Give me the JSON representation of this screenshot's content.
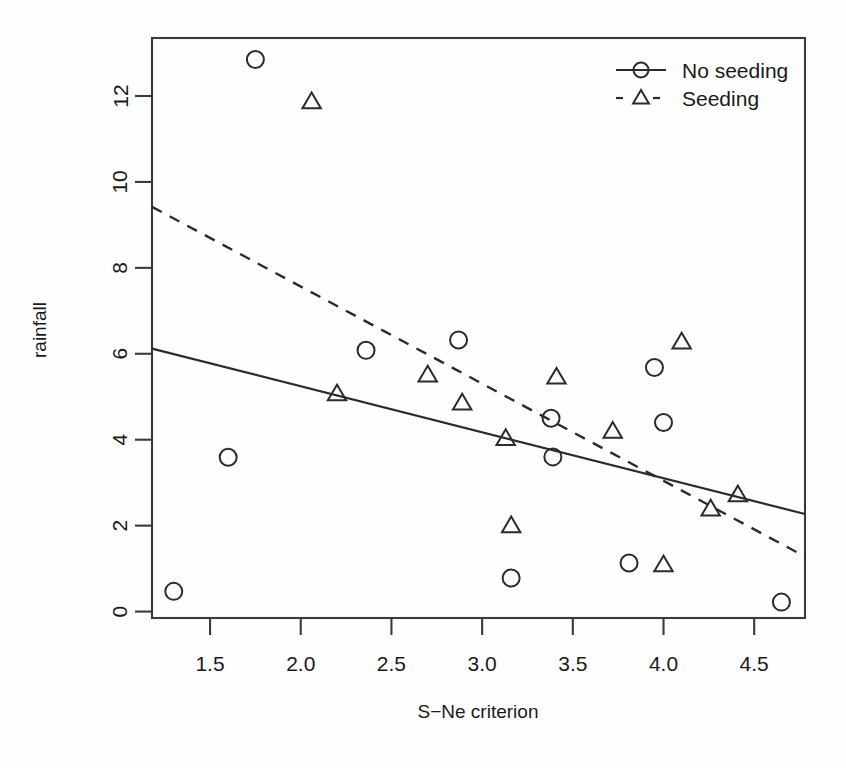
{
  "chart_data": {
    "type": "scatter",
    "title": "",
    "xlabel": "S−Ne criterion",
    "ylabel": "rainfall",
    "xlim": [
      1.18,
      4.78
    ],
    "ylim": [
      -0.15,
      13.35
    ],
    "xticks": [
      1.5,
      2.0,
      2.5,
      3.0,
      3.5,
      4.0,
      4.5
    ],
    "xtick_labels": [
      "1.5",
      "2.0",
      "2.5",
      "3.0",
      "3.5",
      "4.0",
      "4.5"
    ],
    "yticks": [
      0,
      2,
      4,
      6,
      8,
      10,
      12
    ],
    "ytick_labels": [
      "0",
      "2",
      "4",
      "6",
      "8",
      "10",
      "12"
    ],
    "grid": false,
    "legend_position": "top-right",
    "series": [
      {
        "name": "No seeding",
        "marker": "circle",
        "linestyle": "solid",
        "points": [
          {
            "x": 1.3,
            "y": 0.47
          },
          {
            "x": 1.6,
            "y": 3.59
          },
          {
            "x": 1.75,
            "y": 12.85
          },
          {
            "x": 2.36,
            "y": 6.08
          },
          {
            "x": 2.87,
            "y": 6.32
          },
          {
            "x": 3.16,
            "y": 0.78
          },
          {
            "x": 3.38,
            "y": 4.5
          },
          {
            "x": 3.39,
            "y": 3.6
          },
          {
            "x": 3.81,
            "y": 1.13
          },
          {
            "x": 3.95,
            "y": 5.68
          },
          {
            "x": 4.0,
            "y": 4.4
          },
          {
            "x": 4.65,
            "y": 0.22
          }
        ],
        "fit_line": {
          "x1": 1.18,
          "y1": 6.12,
          "x2": 4.78,
          "y2": 2.27
        }
      },
      {
        "name": "Seeding",
        "marker": "triangle",
        "linestyle": "dashed",
        "points": [
          {
            "x": 2.06,
            "y": 11.86
          },
          {
            "x": 2.2,
            "y": 5.06
          },
          {
            "x": 2.7,
            "y": 5.5
          },
          {
            "x": 2.89,
            "y": 4.85
          },
          {
            "x": 3.13,
            "y": 4.02
          },
          {
            "x": 3.16,
            "y": 1.99
          },
          {
            "x": 3.41,
            "y": 5.45
          },
          {
            "x": 3.72,
            "y": 4.19
          },
          {
            "x": 4.0,
            "y": 1.08
          },
          {
            "x": 4.1,
            "y": 6.27
          },
          {
            "x": 4.26,
            "y": 2.38
          },
          {
            "x": 4.41,
            "y": 2.71
          }
        ],
        "fit_line": {
          "x1": 1.18,
          "y1": 9.42,
          "x2": 4.78,
          "y2": 1.28
        }
      }
    ],
    "legend": [
      {
        "label": "No seeding",
        "marker": "circle",
        "linestyle": "solid"
      },
      {
        "label": "Seeding",
        "marker": "triangle",
        "linestyle": "dashed"
      }
    ],
    "colors": {
      "foreground": "#2b2b2b",
      "background": "#ffffff"
    }
  }
}
